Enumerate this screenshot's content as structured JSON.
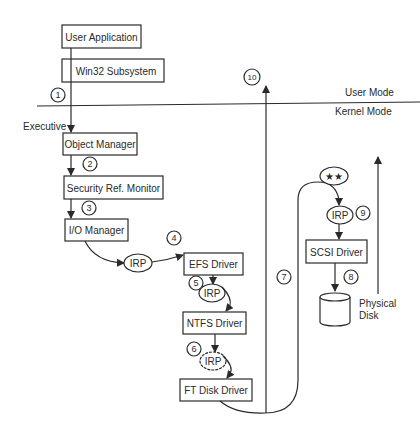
{
  "diagram": {
    "mode_labels": {
      "user": "User Mode",
      "kernel": "Kernel Mode"
    },
    "executive_label": "Executive",
    "components": {
      "user_application": "User Application",
      "win32_subsystem": "Win32 Subsystem",
      "object_manager": "Object Manager",
      "security_ref_monitor": "Security Ref. Monitor",
      "io_manager": "I/O Manager",
      "efs_driver": "EFS Driver",
      "ntfs_driver": "NTFS Driver",
      "ft_disk_driver": "FT Disk Driver",
      "scsi_driver": "SCSI Driver"
    },
    "irp_label": "IRP",
    "stars_label": "★★",
    "physical_disk": {
      "line1": "Physical",
      "line2": "Disk"
    },
    "steps": [
      "1",
      "2",
      "3",
      "4",
      "5",
      "6",
      "7",
      "8",
      "9",
      "10"
    ],
    "colors": {
      "ink": "#2a2a2a",
      "background": "#ffffff"
    }
  }
}
